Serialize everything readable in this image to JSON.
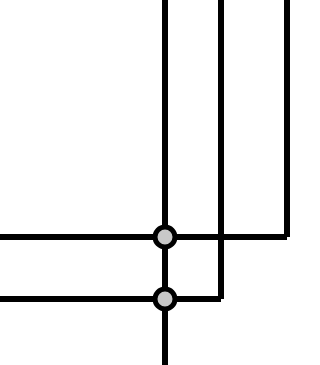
{
  "canvas": {
    "width": 320,
    "height": 365,
    "background_color": "#ffffff",
    "title": "Orthogonal Wire Schematic"
  },
  "style": {
    "wire_color": "#000000",
    "wire_width": 6,
    "junction_fill_color": "#c8c8c8",
    "junction_stroke_color": "#000000",
    "junction_stroke_width": 5,
    "junction_radius": 10
  },
  "geometry": {
    "junctions": [
      {
        "id": "junction-upper",
        "cx": 165,
        "cy": 237,
        "r": 10
      },
      {
        "id": "junction-lower",
        "cx": 165,
        "cy": 299,
        "r": 10
      }
    ],
    "wires": [
      {
        "id": "wire-vertical-trunk",
        "d": "M 165 0 L 165 365"
      },
      {
        "id": "wire-horizontal-upper",
        "d": "M 0 237 L 287 237"
      },
      {
        "id": "wire-horizontal-lower",
        "d": "M 0 299 L 221 299"
      },
      {
        "id": "wire-vertical-middle",
        "d": "M 221 0 L 221 299"
      },
      {
        "id": "wire-vertical-right",
        "d": "M 287 0 L 287 237"
      }
    ]
  },
  "labels": {
    "wire_vertical_trunk": "vertical trunk wire",
    "wire_horizontal_upper": "upper horizontal wire",
    "wire_horizontal_lower": "lower horizontal wire",
    "wire_vertical_middle": "middle vertical wire",
    "wire_vertical_right": "right vertical wire",
    "junction_upper": "upper junction node",
    "junction_lower": "lower junction node"
  }
}
